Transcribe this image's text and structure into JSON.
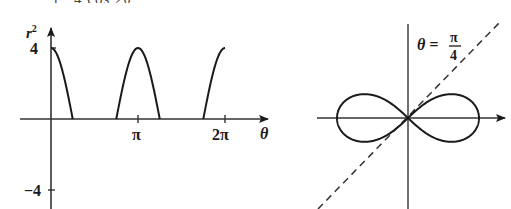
{
  "header": {
    "cropped_fragment_left": "r",
    "cropped_fragment_right": "4 cos 2θ"
  },
  "chart_data": [
    {
      "type": "line",
      "title": "",
      "xlabel": "θ",
      "ylabel": "r²",
      "x_ticks": [
        {
          "value": "π",
          "label": "π"
        },
        {
          "value": "2π",
          "label": "2π"
        }
      ],
      "y_ticks": [
        {
          "value": 4,
          "label": "4"
        },
        {
          "value": -4,
          "label": "-4"
        }
      ],
      "ylim": [
        -4,
        4
      ],
      "xlim": [
        0,
        6.2832
      ],
      "grid": false,
      "function": "r^2 = 4 cos 2θ (plotted only where r^2 ≥ 0)",
      "series": [
        {
          "name": "r^2",
          "segments": [
            {
              "x": [
                0,
                0.3927,
                0.7854
              ],
              "y": [
                4,
                2.83,
                0
              ]
            },
            {
              "x": [
                2.3562,
                2.7489,
                3.1416,
                3.5343,
                3.927
              ],
              "y": [
                0,
                2.83,
                4,
                2.83,
                0
              ]
            },
            {
              "x": [
                5.4978,
                5.8905,
                6.2832
              ],
              "y": [
                0,
                2.83,
                4
              ]
            }
          ]
        }
      ]
    },
    {
      "type": "line",
      "title": "",
      "subtype": "polar (lemniscate)",
      "annotation": {
        "left": "θ =",
        "frac_num": "π",
        "frac_den": "4"
      },
      "function": "r^2 = 4 cos 2θ",
      "x_extent": [
        -2,
        2
      ],
      "asymptote_line": "θ = π/4 (dashed)",
      "grid": false
    }
  ],
  "labels": {
    "left": {
      "ylabel": "r",
      "ylabel_sup": "2",
      "ytick_top": "4",
      "ytick_bottom": "−4",
      "xtick_pi": "π",
      "xtick_2pi": "2π",
      "xlabel": "θ"
    },
    "right": {
      "theta_eq": "θ =",
      "pi": "π",
      "four": "4"
    }
  },
  "colors": {
    "ink": "#1a1a1a",
    "axis": "#333333",
    "background": "#ffffff"
  }
}
